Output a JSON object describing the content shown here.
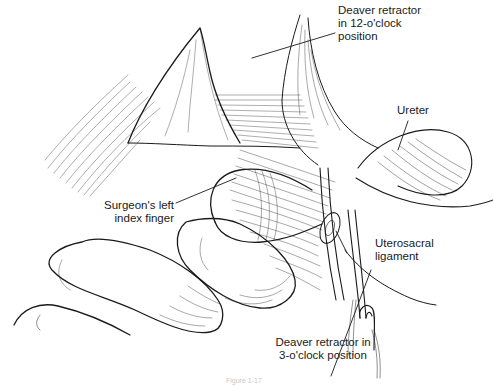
{
  "figure": {
    "caption": "Figure 1-17",
    "background": "#ffffff",
    "ink_color": "#1a1a1a"
  },
  "labels": {
    "deaver_12": {
      "line1": "Deaver retractor",
      "line2": "in 12-o'clock",
      "line3": "position"
    },
    "ureter": {
      "line1": "Ureter"
    },
    "index_finger": {
      "line1": "Surgeon's left",
      "line2": "index finger"
    },
    "uterosacral": {
      "line1": "Uterosacral",
      "line2": "ligament"
    },
    "deaver_3": {
      "line1": "Deaver retractor in",
      "line2": "3-o'clock position"
    }
  }
}
